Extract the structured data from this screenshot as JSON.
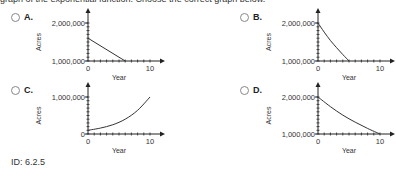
{
  "prompt": "graph of the exponential function. Choose the correct graph below.",
  "options": [
    {
      "label": "A."
    },
    {
      "label": "B."
    },
    {
      "label": "C."
    },
    {
      "label": "D."
    }
  ],
  "footer": {
    "id": "ID: 6.2.5"
  },
  "chart_data": [
    {
      "option": "A",
      "type": "line",
      "xlabel": "Year",
      "ylabel": "Acres",
      "x_ticks": [
        "0",
        "10"
      ],
      "y_ticks": [
        "1,000,000",
        "2,000,000"
      ],
      "xlim": [
        0,
        10.5
      ],
      "ylim": [
        1000000,
        2200000
      ],
      "series": [
        {
          "name": "A",
          "x": [
            0,
            6
          ],
          "y": [
            1600000,
            1000000
          ]
        }
      ]
    },
    {
      "option": "B",
      "type": "line",
      "xlabel": "Year",
      "ylabel": "Acres",
      "x_ticks": [
        "0",
        "10"
      ],
      "y_ticks": [
        "1,000,000",
        "2,000,000"
      ],
      "xlim": [
        0,
        10.5
      ],
      "ylim": [
        1000000,
        2200000
      ],
      "series": [
        {
          "name": "B",
          "x": [
            0,
            1,
            2,
            3,
            4,
            5
          ],
          "y": [
            2000000,
            1760000,
            1540000,
            1350000,
            1170000,
            1000000
          ]
        }
      ]
    },
    {
      "option": "C",
      "type": "line",
      "xlabel": "Year",
      "ylabel": "Acres",
      "x_ticks": [
        "0",
        "10"
      ],
      "y_ticks": [
        "0",
        "1,000,000"
      ],
      "xlim": [
        0,
        10.5
      ],
      "ylim": [
        0,
        1200000
      ],
      "series": [
        {
          "name": "C",
          "x": [
            0,
            2,
            4,
            6,
            8,
            10
          ],
          "y": [
            100000,
            160000,
            250000,
            400000,
            640000,
            1000000
          ]
        }
      ]
    },
    {
      "option": "D",
      "type": "line",
      "xlabel": "Year",
      "ylabel": "Acres",
      "x_ticks": [
        "0",
        "10"
      ],
      "y_ticks": [
        "1,000,000",
        "2,000,000"
      ],
      "xlim": [
        0,
        10.5
      ],
      "ylim": [
        1000000,
        2200000
      ],
      "series": [
        {
          "name": "D",
          "x": [
            0,
            2,
            4,
            6,
            8,
            10
          ],
          "y": [
            2000000,
            1740000,
            1510000,
            1320000,
            1150000,
            1000000
          ]
        }
      ]
    }
  ]
}
